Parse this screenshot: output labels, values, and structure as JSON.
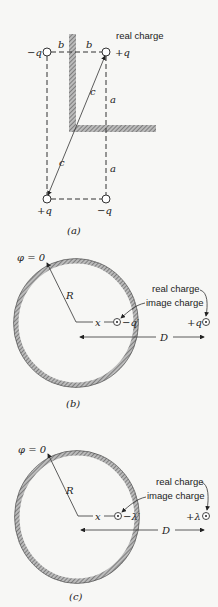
{
  "figure_a": {
    "caption": "(a)",
    "real_charge_label": "real charge",
    "charges": [
      {
        "label": "−q",
        "pos": "top-left"
      },
      {
        "label": "+q",
        "pos": "top-right"
      },
      {
        "label": "+q",
        "pos": "bottom-left"
      },
      {
        "label": "−q",
        "pos": "bottom-right"
      }
    ],
    "distance_labels": {
      "b_left": "b",
      "b_right": "b",
      "c_upper": "c",
      "c_lower": "c",
      "a_upper": "a",
      "a_lower": "a"
    }
  },
  "figure_b": {
    "caption": "(b)",
    "potential_label": "φ = 0",
    "radius_label": "R",
    "x_label": "x",
    "image_charge_value": "−q′",
    "real_charge_value": "+q",
    "real_charge_label": "real charge",
    "image_charge_label": "image charge",
    "distance_label": "D"
  },
  "figure_c": {
    "caption": "(c)",
    "potential_label": "φ = 0",
    "radius_label": "R",
    "x_label": "x",
    "image_charge_value": "−λ′",
    "real_charge_value": "+λ",
    "real_charge_label": "real charge",
    "image_charge_label": "image charge",
    "distance_label": "D"
  }
}
